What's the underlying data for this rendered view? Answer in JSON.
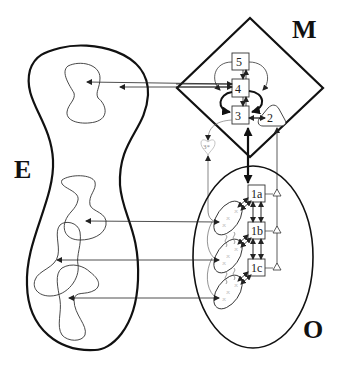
{
  "diagram": {
    "regions": {
      "environment": {
        "label": "E"
      },
      "management": {
        "label": "M"
      },
      "operations": {
        "label": "O"
      }
    },
    "systems": {
      "s5": {
        "label": "5"
      },
      "s4": {
        "label": "4"
      },
      "s3": {
        "label": "3"
      },
      "s2": {
        "label": "2"
      },
      "s3star": {
        "label": "3*"
      },
      "s1a": {
        "label": "1a"
      },
      "s1b": {
        "label": "1b"
      },
      "s1c": {
        "label": "1c"
      }
    },
    "colors": {
      "line": "#111111",
      "thin_line": "#333333",
      "faint": "#999999",
      "background": "#ffffff"
    }
  }
}
